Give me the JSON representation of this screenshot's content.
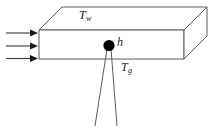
{
  "figure": {
    "background_color": "#ffffff",
    "line_color": "#555555",
    "bead_color": "#000000",
    "arrow_color": "#3a3a3a",
    "labels": {
      "wall_temperature": {
        "symbol": "T",
        "subscript": "w"
      },
      "heat_transfer_coefficient": {
        "symbol": "h",
        "subscript": ""
      },
      "gas_temperature": {
        "symbol": "T",
        "subscript": "g"
      }
    },
    "elements": {
      "slab_name": "rectangular-duct-slab",
      "bead_name": "thermocouple-bead",
      "lead_wire_count": 2,
      "flow_arrow_count": 3
    }
  }
}
